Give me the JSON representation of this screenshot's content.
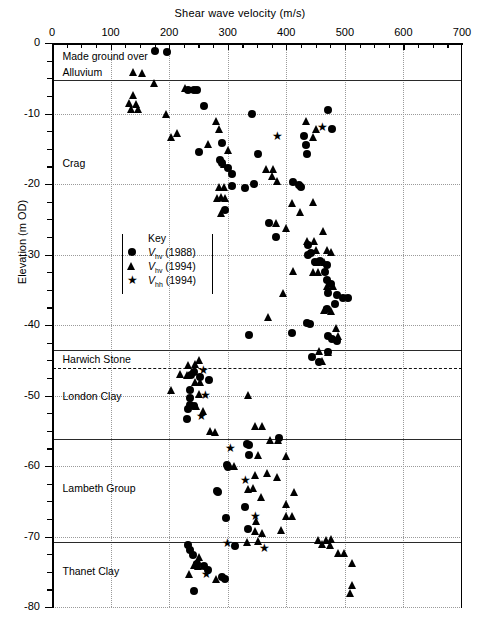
{
  "chart_data": {
    "type": "scatter",
    "title": "",
    "xlabel": "Shear wave velocity (m/s)",
    "ylabel": "Elevation (m OD)",
    "xlim": [
      0,
      700
    ],
    "ylim": [
      -80,
      0
    ],
    "xticks": [
      0,
      100,
      200,
      300,
      400,
      500,
      600,
      700
    ],
    "xtick_minor_step": 25,
    "yticks": [
      0,
      -10,
      -20,
      -30,
      -40,
      -50,
      -60,
      -70,
      -80
    ],
    "ytick_minor_step": 2.5,
    "grid": "dotted major grid on both axes",
    "legend_position": "inside-left-middle",
    "legend_title": "Key",
    "series": [
      {
        "name": "Vhv (1988)",
        "symbol_label": "V",
        "subscript": "hv",
        "year": "(1988)",
        "marker": "circle",
        "color": "#000000",
        "points": [
          [
            176,
            -1.2
          ],
          [
            196,
            -1.3
          ],
          [
            232,
            -6.6
          ],
          [
            242,
            -6.6
          ],
          [
            248,
            -6.7
          ],
          [
            259,
            -9.0
          ],
          [
            341,
            -10.0
          ],
          [
            471,
            -9.5
          ],
          [
            478,
            -12.2
          ],
          [
            251,
            -15.4
          ],
          [
            291,
            -14.2
          ],
          [
            291,
            -17.0
          ],
          [
            300,
            -17.8
          ],
          [
            307,
            -18.6
          ],
          [
            351,
            -15.8
          ],
          [
            431,
            -13.2
          ],
          [
            434,
            -14.5
          ],
          [
            436,
            -15.8
          ],
          [
            307,
            -20.3
          ],
          [
            329,
            -20.6
          ],
          [
            345,
            -20.0
          ],
          [
            411,
            -19.7
          ],
          [
            421,
            -20.2
          ],
          [
            286,
            -16.6
          ],
          [
            425,
            -20.4
          ],
          [
            296,
            -23.7
          ],
          [
            371,
            -25.6
          ],
          [
            383,
            -27.5
          ],
          [
            437,
            -28.7
          ],
          [
            442,
            -29.8
          ],
          [
            457,
            -30.9
          ],
          [
            470,
            -31.5
          ],
          [
            466,
            -32.5
          ],
          [
            437,
            -30.0
          ],
          [
            449,
            -31.0
          ],
          [
            470,
            -33.6
          ],
          [
            477,
            -34.2
          ],
          [
            471,
            -35.4
          ],
          [
            486,
            -35.7
          ],
          [
            496,
            -36.2
          ],
          [
            505,
            -36.1
          ],
          [
            470,
            -37.8
          ],
          [
            483,
            -37.0
          ],
          [
            436,
            -39.7
          ],
          [
            441,
            -39.8
          ],
          [
            409,
            -41.2
          ],
          [
            472,
            -41.5
          ],
          [
            478,
            -42.0
          ],
          [
            486,
            -42.2
          ],
          [
            336,
            -41.4
          ],
          [
            471,
            -43.9
          ],
          [
            444,
            -44.6
          ],
          [
            455,
            -45.2
          ],
          [
            243,
            -46.6
          ],
          [
            238,
            -47.1
          ],
          [
            252,
            -47.4
          ],
          [
            268,
            -47.8
          ],
          [
            235,
            -49.2
          ],
          [
            235,
            -50.4
          ],
          [
            236,
            -51.3
          ],
          [
            232,
            -51.9
          ],
          [
            243,
            -51.5
          ],
          [
            231,
            -53.4
          ],
          [
            388,
            -56.0
          ],
          [
            333,
            -56.9
          ],
          [
            336,
            -57.0
          ],
          [
            298,
            -59.9
          ],
          [
            300,
            -60.2
          ],
          [
            336,
            -58.4
          ],
          [
            282,
            -63.6
          ],
          [
            284,
            -63.7
          ],
          [
            330,
            -65.8
          ],
          [
            334,
            -69.0
          ],
          [
            297,
            -67.4
          ],
          [
            232,
            -71.2
          ],
          [
            236,
            -71.9
          ],
          [
            241,
            -72.6
          ],
          [
            247,
            -73.9
          ],
          [
            259,
            -74.2
          ],
          [
            266,
            -74.8
          ],
          [
            291,
            -75.8
          ],
          [
            296,
            -76.0
          ],
          [
            243,
            -77.8
          ],
          [
            312,
            -71.4
          ]
        ]
      },
      {
        "name": "Vhv (1994)",
        "symbol_label": "V",
        "subscript": "hv",
        "year": "(1994)",
        "marker": "triangle",
        "color": "#000000",
        "points": [
          [
            139,
            -4.2
          ],
          [
            154,
            -4.3
          ],
          [
            176,
            -5.8
          ],
          [
            140,
            -7.4
          ],
          [
            132,
            -8.6
          ],
          [
            144,
            -8.7
          ],
          [
            136,
            -9.4
          ],
          [
            148,
            -9.5
          ],
          [
            228,
            -6.4
          ],
          [
            196,
            -10.1
          ],
          [
            215,
            -12.8
          ],
          [
            205,
            -13.4
          ],
          [
            281,
            -11.1
          ],
          [
            435,
            -11.2
          ],
          [
            452,
            -12.3
          ],
          [
            446,
            -13.4
          ],
          [
            286,
            -12.3
          ],
          [
            268,
            -14.4
          ],
          [
            302,
            -15.3
          ],
          [
            294,
            -17.3
          ],
          [
            366,
            -17.9
          ],
          [
            379,
            -17.9
          ],
          [
            377,
            -19.0
          ],
          [
            385,
            -19.6
          ],
          [
            286,
            -20.5
          ],
          [
            294,
            -20.5
          ],
          [
            289,
            -21.9
          ],
          [
            296,
            -22.0
          ],
          [
            283,
            -22.0
          ],
          [
            411,
            -22.7
          ],
          [
            446,
            -22.6
          ],
          [
            289,
            -24.2
          ],
          [
            424,
            -24.0
          ],
          [
            383,
            -25.6
          ],
          [
            400,
            -26.3
          ],
          [
            463,
            -26.7
          ],
          [
            437,
            -28.1
          ],
          [
            448,
            -28.2
          ],
          [
            452,
            -29.4
          ],
          [
            470,
            -29.5
          ],
          [
            478,
            -29.7
          ],
          [
            454,
            -31.2
          ],
          [
            465,
            -31.1
          ],
          [
            446,
            -32.5
          ],
          [
            455,
            -32.6
          ],
          [
            412,
            -32.4
          ],
          [
            395,
            -35.6
          ],
          [
            470,
            -34.6
          ],
          [
            481,
            -34.5
          ],
          [
            466,
            -38.0
          ],
          [
            477,
            -38.1
          ],
          [
            369,
            -38.9
          ],
          [
            486,
            -40.5
          ],
          [
            490,
            -41.7
          ],
          [
            457,
            -43.8
          ],
          [
            472,
            -43.9
          ],
          [
            462,
            -45.2
          ],
          [
            233,
            -45.8
          ],
          [
            245,
            -45.6
          ],
          [
            252,
            -45.1
          ],
          [
            219,
            -47.0
          ],
          [
            232,
            -47.2
          ],
          [
            246,
            -48.1
          ],
          [
            254,
            -48.2
          ],
          [
            205,
            -49.3
          ],
          [
            252,
            -49.9
          ],
          [
            335,
            -50.0
          ],
          [
            247,
            -51.6
          ],
          [
            258,
            -52.3
          ],
          [
            270,
            -55.1
          ],
          [
            280,
            -55.2
          ],
          [
            347,
            -54.4
          ],
          [
            359,
            -54.4
          ],
          [
            374,
            -56.4
          ],
          [
            387,
            -56.4
          ],
          [
            352,
            -58.5
          ],
          [
            400,
            -58.7
          ],
          [
            311,
            -60.0
          ],
          [
            368,
            -61.0
          ],
          [
            348,
            -61.4
          ],
          [
            385,
            -61.6
          ],
          [
            335,
            -63.4
          ],
          [
            345,
            -63.2
          ],
          [
            357,
            -64.4
          ],
          [
            414,
            -63.7
          ],
          [
            401,
            -65.5
          ],
          [
            400,
            -67.2
          ],
          [
            411,
            -67.2
          ],
          [
            350,
            -67.9
          ],
          [
            347,
            -69.3
          ],
          [
            360,
            -69.6
          ],
          [
            392,
            -69.2
          ],
          [
            334,
            -70.9
          ],
          [
            352,
            -70.7
          ],
          [
            456,
            -70.5
          ],
          [
            468,
            -70.5
          ],
          [
            478,
            -70.4
          ],
          [
            252,
            -73.0
          ],
          [
            243,
            -74.1
          ],
          [
            250,
            -74.3
          ],
          [
            235,
            -75.4
          ],
          [
            281,
            -76.1
          ],
          [
            489,
            -72.4
          ],
          [
            500,
            -72.4
          ],
          [
            513,
            -73.8
          ],
          [
            513,
            -77.0
          ],
          [
            510,
            -78.1
          ],
          [
            462,
            -71.2
          ],
          [
            476,
            -71.3
          ]
        ]
      },
      {
        "name": "Vhh (1994)",
        "symbol_label": "V",
        "subscript": "hh",
        "year": "(1994)",
        "marker": "star",
        "color": "#000000",
        "points": [
          [
            462,
            -12.0
          ],
          [
            385,
            -13.3
          ],
          [
            258,
            -46.4
          ],
          [
            262,
            -50.0
          ],
          [
            255,
            -53.0
          ],
          [
            305,
            -57.5
          ],
          [
            331,
            -62.0
          ],
          [
            348,
            -67.2
          ],
          [
            362,
            -71.7
          ],
          [
            264,
            -75.4
          ],
          [
            300,
            -71.0
          ]
        ]
      }
    ],
    "strat_boundaries": [
      {
        "elevation": -5.2,
        "style": "solid"
      },
      {
        "elevation": -43.6,
        "style": "solid"
      },
      {
        "elevation": -46.1,
        "style": "dashed"
      },
      {
        "elevation": -56.2,
        "style": "solid"
      },
      {
        "elevation": -70.8,
        "style": "solid"
      }
    ],
    "strat_labels": [
      {
        "text": "Made ground over",
        "elevation": -2.0,
        "velocity": 18
      },
      {
        "text": "Alluvium",
        "elevation": -4.3,
        "velocity": 18
      },
      {
        "text": "Crag",
        "elevation": -17.2,
        "velocity": 18
      },
      {
        "text": "Harwich Stone",
        "elevation": -44.9,
        "velocity": 18
      },
      {
        "text": "London Clay",
        "elevation": -50.2,
        "velocity": 18
      },
      {
        "text": "Lambeth Group",
        "elevation": -63.3,
        "velocity": 18
      },
      {
        "text": "Thanet Clay",
        "elevation": -75.0,
        "velocity": 18
      }
    ]
  }
}
